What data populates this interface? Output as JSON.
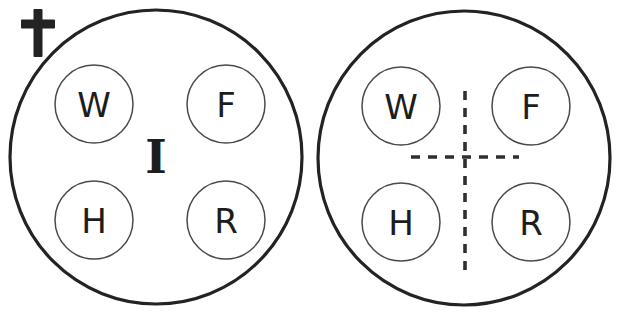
{
  "figure": {
    "title": "",
    "background_color": "#ffffff",
    "stroke_color": "#232323",
    "inner_stroke_color": "#4a4a4a",
    "dash_color": "#2f2f2f"
  },
  "marks": {
    "cross": {
      "name": "latin-cross",
      "glyph": "✝",
      "x": 38,
      "y": 30
    }
  },
  "panels": [
    {
      "id": "left-panel",
      "label": "",
      "outer": {
        "cx": 156,
        "cy": 157,
        "rx": 146,
        "ry": 147
      },
      "center_label": "I",
      "has_center_label": true,
      "has_dashed_cross": false,
      "nodes": [
        {
          "id": "left-node-w",
          "label": "W",
          "cx": 94,
          "cy": 104,
          "r": 39
        },
        {
          "id": "left-node-f",
          "label": "F",
          "cx": 226,
          "cy": 104,
          "r": 39
        },
        {
          "id": "left-node-h",
          "label": "H",
          "cx": 94,
          "cy": 220,
          "r": 39
        },
        {
          "id": "left-node-r",
          "label": "R",
          "cx": 226,
          "cy": 220,
          "r": 39
        }
      ]
    },
    {
      "id": "right-panel",
      "label": "",
      "outer": {
        "cx": 464,
        "cy": 158,
        "rx": 146,
        "ry": 147
      },
      "center_label": "",
      "has_center_label": false,
      "has_dashed_cross": true,
      "dashed_cross": {
        "vertical": {
          "x": 465,
          "y1": 91,
          "y2": 273
        },
        "horizontal": {
          "y": 157,
          "x1": 411,
          "x2": 519
        }
      },
      "nodes": [
        {
          "id": "right-node-w",
          "label": "W",
          "cx": 401,
          "cy": 106,
          "r": 39
        },
        {
          "id": "right-node-f",
          "label": "F",
          "cx": 531,
          "cy": 106,
          "r": 39
        },
        {
          "id": "right-node-h",
          "label": "H",
          "cx": 401,
          "cy": 222,
          "r": 39
        },
        {
          "id": "right-node-r",
          "label": "R",
          "cx": 531,
          "cy": 222,
          "r": 39
        }
      ]
    }
  ]
}
